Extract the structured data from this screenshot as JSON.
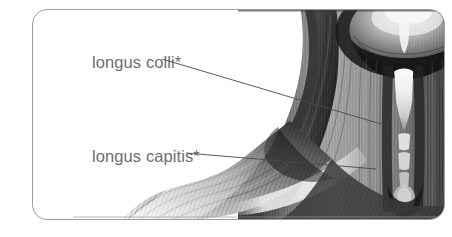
{
  "figure": {
    "card": {
      "border_color": "#9e9e9e",
      "background_color": "#ffffff",
      "corner_radius_px": 15
    },
    "labels": [
      {
        "id": "longus-colli",
        "text": "longus colli*",
        "color": "#6e6e6e",
        "leader_line": {
          "from_x": 162,
          "from_y": 59,
          "to_x": 381,
          "to_y": 124,
          "color": "#4a4a4a"
        }
      },
      {
        "id": "longus-capitis",
        "text": "longus capitis*",
        "color": "#6e6e6e",
        "leader_line": {
          "from_x": 186,
          "from_y": 153,
          "to_x": 376,
          "to_y": 169,
          "color": "#4a4a4a"
        }
      }
    ],
    "illustration": {
      "name": "grayscale-anterior-neck-anatomy",
      "description": "Grayscale anatomical drawing of the anterior neck showing the skull base, deep cervical muscles and the shoulder.",
      "tone_dark": "#1f1f1f",
      "tone_mid": "#6b6b6b",
      "tone_light": "#d8d8d8",
      "tone_highlight": "#f2f2f2"
    }
  }
}
